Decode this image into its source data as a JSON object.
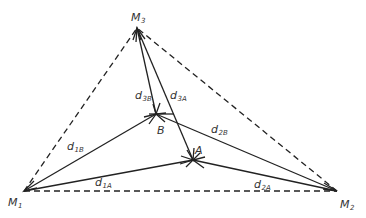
{
  "diagram": {
    "type": "triangulation-geometry",
    "stroke_color": "#222222",
    "label_color": "#333333",
    "points": {
      "M1": {
        "x": 24,
        "y": 191,
        "label": "M",
        "sub": "1"
      },
      "M2": {
        "x": 337,
        "y": 191,
        "label": "M",
        "sub": "2"
      },
      "M3": {
        "x": 137,
        "y": 28,
        "label": "M",
        "sub": "3"
      },
      "A": {
        "x": 193,
        "y": 160,
        "label": "A"
      },
      "B": {
        "x": 156,
        "y": 114,
        "label": "B"
      }
    },
    "dashed_edges": [
      [
        "M1",
        "M2"
      ],
      [
        "M1",
        "M3"
      ],
      [
        "M2",
        "M3"
      ]
    ],
    "solid_edges": [
      {
        "from": "M1",
        "to": "B",
        "label": "d",
        "sub": "1B"
      },
      {
        "from": "M1",
        "to": "A",
        "label": "d",
        "sub": "1A"
      },
      {
        "from": "M2",
        "to": "B",
        "label": "d",
        "sub": "2B"
      },
      {
        "from": "M2",
        "to": "A",
        "label": "d",
        "sub": "2A"
      },
      {
        "from": "M3",
        "to": "B",
        "label": "d",
        "sub": "3B"
      },
      {
        "from": "M3",
        "to": "A",
        "label": "d",
        "sub": "3A"
      }
    ],
    "labels": {
      "m1": {
        "main": "M",
        "sub": "1"
      },
      "m2": {
        "main": "M",
        "sub": "2"
      },
      "m3": {
        "main": "M",
        "sub": "3"
      },
      "a": {
        "main": "A"
      },
      "b": {
        "main": "B"
      },
      "d1a": {
        "main": "d",
        "sub": "1A"
      },
      "d1b": {
        "main": "d",
        "sub": "1B"
      },
      "d2a": {
        "main": "d",
        "sub": "2A"
      },
      "d2b": {
        "main": "d",
        "sub": "2B"
      },
      "d3a": {
        "main": "d",
        "sub": "3A"
      },
      "d3b": {
        "main": "d",
        "sub": "3B"
      }
    }
  }
}
